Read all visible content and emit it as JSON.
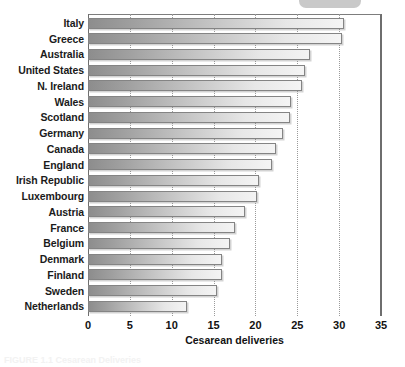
{
  "top_pill": {
    "name": "rounded-pill-element"
  },
  "caption": {
    "text": "FIGURE 1.1 Cesarean Deliveries"
  },
  "chart_data": {
    "type": "bar",
    "orientation": "horizontal",
    "title": "",
    "subtitle": "",
    "xlabel": "Cesarean deliveries",
    "ylabel": "",
    "xlim": [
      0,
      35
    ],
    "xticks": [
      0,
      5,
      10,
      15,
      20,
      25,
      30,
      35
    ],
    "xtick_labels": [
      "0",
      "5",
      "10",
      "15",
      "20",
      "25",
      "30",
      "35"
    ],
    "grid": "vertical-dotted",
    "legend": null,
    "legend_position": "none",
    "categories": [
      "Italy",
      "Greece",
      "Australia",
      "United States",
      "N. Ireland",
      "Wales",
      "Scotland",
      "Germany",
      "Canada",
      "England",
      "Irish Republic",
      "Luxembourg",
      "Austria",
      "France",
      "Belgium",
      "Denmark",
      "Finland",
      "Sweden",
      "Netherlands"
    ],
    "values": [
      30.6,
      30.3,
      26.5,
      25.9,
      25.6,
      24.3,
      24.1,
      23.3,
      22.4,
      22.0,
      20.4,
      20.2,
      18.8,
      17.5,
      17.0,
      16.0,
      16.0,
      15.4,
      11.8
    ],
    "bar_fill": "linear-gradient grey dark-to-light",
    "bar_border_color": "#848484",
    "axis_color": "#6e6e6e",
    "gridline_color": "#9a9a9a",
    "text_color": "#121212"
  }
}
